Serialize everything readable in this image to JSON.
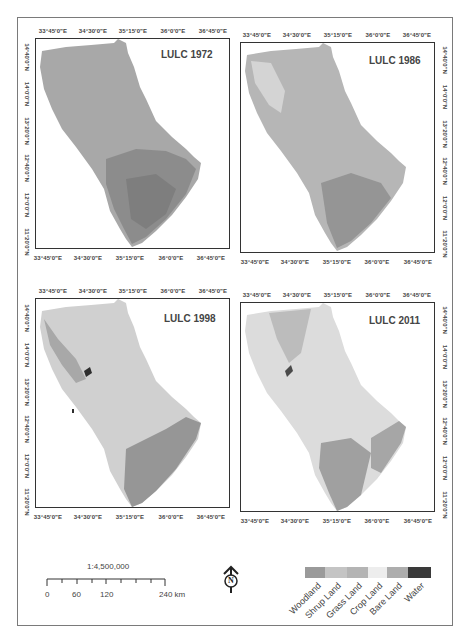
{
  "figure": {
    "panels": [
      {
        "id": "p1972",
        "title": "LULC 1972",
        "position": "top-left"
      },
      {
        "id": "p1986",
        "title": "LULC 1986",
        "position": "top-right"
      },
      {
        "id": "p1998",
        "title": "LULC 1998",
        "position": "bottom-left"
      },
      {
        "id": "p2011",
        "title": "LULC 2011",
        "position": "bottom-right"
      }
    ],
    "longitude_ticks": [
      "33°45'0\"E",
      "34°30'0\"E",
      "35°15'0\"E",
      "36°0'0\"E",
      "36°45'0\"E"
    ],
    "latitude_ticks": [
      "14°40'0\"N",
      "14°0'0\"N",
      "13°20'0\"N",
      "12°40'0\"N",
      "12°0'0\"N",
      "11°20'0\"N"
    ],
    "scale": {
      "ratio": "1:4,500,000",
      "labels": [
        "0",
        "60",
        "120",
        "240 km"
      ]
    },
    "north_arrow": {
      "letter": "N"
    },
    "legend": {
      "items": [
        {
          "label": "Woodland",
          "color": "#9a9a9a"
        },
        {
          "label": "Shrup Land",
          "color": "#c4c4c4"
        },
        {
          "label": "Grass Land",
          "color": "#b4b4b4"
        },
        {
          "label": "Crop Land",
          "color": "#ededed"
        },
        {
          "label": "Bare Land",
          "color": "#adadad"
        },
        {
          "label": "Water",
          "color": "#3a3a3a"
        }
      ]
    }
  }
}
